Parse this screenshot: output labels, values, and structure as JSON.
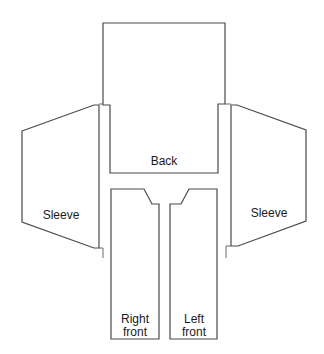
{
  "diagram": {
    "type": "sewing-pattern-layout",
    "pieces": [
      {
        "id": "back",
        "label": "Back"
      },
      {
        "id": "left-sleeve",
        "label": "Sleeve"
      },
      {
        "id": "right-sleeve",
        "label": "Sleeve"
      },
      {
        "id": "right-front",
        "label_line1": "Right",
        "label_line2": "front"
      },
      {
        "id": "left-front",
        "label_line1": "Left",
        "label_line2": "front"
      }
    ],
    "colors": {
      "stroke": "#4a4a4a",
      "fill": "#ffffff",
      "text": "#1a1a1a"
    }
  }
}
